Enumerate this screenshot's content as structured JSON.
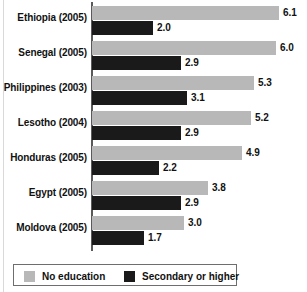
{
  "chart_data": {
    "type": "bar",
    "orientation": "horizontal",
    "title": "",
    "xlabel": "",
    "ylabel": "",
    "grid": false,
    "xlim": [
      0,
      6.1
    ],
    "legend_position": "bottom",
    "categories": [
      "Ethiopia (2005)",
      "Senegal (2005)",
      "Philippines (2003)",
      "Lesotho (2004)",
      "Honduras (2005)",
      "Egypt (2005)",
      "Moldova (2005)"
    ],
    "series": [
      {
        "name": "No education",
        "color": "#b8b8b8",
        "values": [
          6.1,
          6.0,
          5.3,
          5.2,
          4.9,
          3.8,
          3.0
        ]
      },
      {
        "name": "Secondary or higher",
        "color": "#1a1a1a",
        "values": [
          2.0,
          2.9,
          3.1,
          2.9,
          2.2,
          2.9,
          1.7
        ]
      }
    ],
    "value_labels": [
      [
        "6.1",
        "2.0"
      ],
      [
        "6.0",
        "2.9"
      ],
      [
        "5.3",
        "3.1"
      ],
      [
        "5.2",
        "2.9"
      ],
      [
        "4.9",
        "2.2"
      ],
      [
        "3.8",
        "2.9"
      ],
      [
        "3.0",
        "1.7"
      ]
    ]
  },
  "legend": {
    "items": [
      {
        "label": "No education",
        "color": "#b8b8b8"
      },
      {
        "label": "Secondary or higher",
        "color": "#1a1a1a"
      }
    ]
  },
  "layout": {
    "axis_x": 91,
    "bar_origin_x": 92,
    "px_per_unit": 30.6,
    "group_pitch": 35,
    "group_top": 4,
    "bar_height": 14
  }
}
